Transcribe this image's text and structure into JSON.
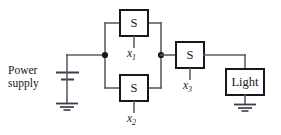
{
  "diagram": {
    "canvas": {
      "width": 281,
      "height": 135
    },
    "colors": {
      "wire": "#5a5f68",
      "component_outline": "#16181b",
      "background": "#ffffff",
      "text": "#16181b"
    },
    "power_supply": {
      "label_line1": "Power",
      "label_line2": "supply",
      "symbol": "battery-cell"
    },
    "switches": [
      {
        "id": "s1",
        "box_label": "S",
        "variable": "x",
        "subscript": "1",
        "position": "top-parallel-branch"
      },
      {
        "id": "s2",
        "box_label": "S",
        "variable": "x",
        "subscript": "2",
        "position": "bottom-parallel-branch"
      },
      {
        "id": "s3",
        "box_label": "S",
        "variable": "x",
        "subscript": "3",
        "position": "series-after-parallel"
      }
    ],
    "load": {
      "id": "light",
      "box_label": "Light"
    },
    "grounds": [
      {
        "id": "ground-power-supply"
      },
      {
        "id": "ground-light"
      }
    ],
    "junctions": [
      {
        "id": "junction-left",
        "x": 105,
        "y": 55
      },
      {
        "id": "junction-right",
        "x": 161,
        "y": 55
      }
    ]
  }
}
